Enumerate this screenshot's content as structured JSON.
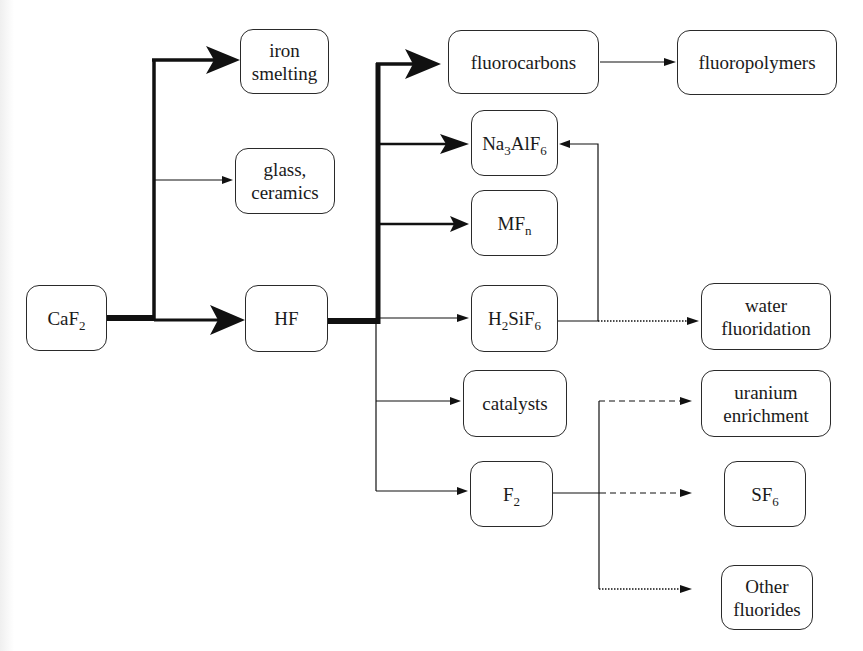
{
  "diagram": {
    "nodes": {
      "caf2": {
        "base": "CaF",
        "sub": "2",
        "after": ""
      },
      "iron": {
        "line1": "iron",
        "line2": "smelting"
      },
      "glass": {
        "line1": "glass,",
        "line2": "ceramics"
      },
      "hf": {
        "label": "HF"
      },
      "fluorocarbons": {
        "label": "fluorocarbons"
      },
      "fluoropolymers": {
        "label": "fluoropolymers"
      },
      "na3alf6": {
        "p1": "Na",
        "s1": "3",
        "p2": "AlF",
        "s2": "6"
      },
      "mfn": {
        "base": "MF",
        "sub": "n"
      },
      "h2sif6": {
        "p1": "H",
        "s1": "2",
        "p2": "SiF",
        "s2": "6"
      },
      "catalysts": {
        "label": "catalysts"
      },
      "f2": {
        "base": "F",
        "sub": "2"
      },
      "water": {
        "line1": "water",
        "line2": "fluoridation"
      },
      "uranium": {
        "line1": "uranium",
        "line2": "enrichment"
      },
      "sf6": {
        "base": "SF",
        "sub": "6"
      },
      "other": {
        "line1": "Other",
        "line2": "fluorides"
      }
    },
    "edges": [
      {
        "from": "CaF2",
        "to": "iron smelting",
        "style": "thick"
      },
      {
        "from": "CaF2",
        "to": "glass, ceramics",
        "style": "thin"
      },
      {
        "from": "CaF2",
        "to": "HF",
        "style": "thick"
      },
      {
        "from": "HF",
        "to": "fluorocarbons",
        "style": "thick"
      },
      {
        "from": "HF",
        "to": "Na3AlF6",
        "style": "medium"
      },
      {
        "from": "HF",
        "to": "MFn",
        "style": "medium"
      },
      {
        "from": "HF",
        "to": "H2SiF6",
        "style": "thin"
      },
      {
        "from": "HF",
        "to": "catalysts",
        "style": "thin"
      },
      {
        "from": "HF",
        "to": "F2",
        "style": "thin"
      },
      {
        "from": "fluorocarbons",
        "to": "fluoropolymers",
        "style": "thin"
      },
      {
        "from": "H2SiF6",
        "to": "Na3AlF6",
        "style": "thin"
      },
      {
        "from": "H2SiF6",
        "to": "water fluoridation",
        "style": "dotted"
      },
      {
        "from": "F2",
        "to": "uranium enrichment",
        "style": "dashed"
      },
      {
        "from": "F2",
        "to": "SF6",
        "style": "dashed"
      },
      {
        "from": "F2",
        "to": "Other fluorides",
        "style": "dotted"
      }
    ],
    "colors": {
      "line": "#111111",
      "box_border": "#2a2a2a",
      "background": "#ffffff"
    }
  }
}
